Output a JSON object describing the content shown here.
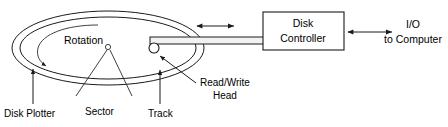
{
  "diagram": {
    "labels": {
      "rotation": "Rotation",
      "disk_platter": "Disk Plotter",
      "sector": "Sector",
      "track": "Track",
      "read_write_head_line1": "Read/Write",
      "read_write_head_line2": "Head",
      "disk_controller_line1": "Disk",
      "disk_controller_line2": "Controller",
      "io_line1": "I/O",
      "io_line2": "to Computer"
    },
    "icons": {
      "rotation_arrow": "curved-arrow-icon",
      "seek_arrow": "double-headed-arrow-icon",
      "io_arrow": "double-headed-arrow-icon",
      "platter_leader": "leader-arrow-icon",
      "track_leader": "leader-arrow-icon",
      "head_leader": "leader-arrow-icon"
    },
    "colors": {
      "stroke": "#1a1a1a",
      "background": "#ffffff",
      "arm_fill": "#f2f2f2"
    }
  }
}
